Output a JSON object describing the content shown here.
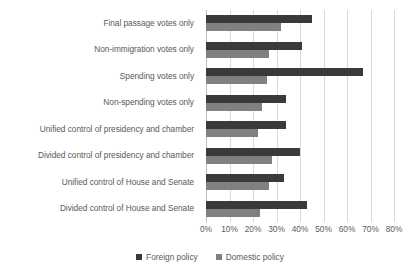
{
  "chart_data": {
    "type": "bar",
    "orientation": "horizontal",
    "title": "",
    "subtitle": "",
    "xlabel": "",
    "ylabel": "",
    "xlim": [
      0,
      80
    ],
    "xticks": [
      "0%",
      "10%",
      "20%",
      "30%",
      "40%",
      "50%",
      "60%",
      "70%",
      "80%"
    ],
    "xtick_values": [
      0,
      10,
      20,
      30,
      40,
      50,
      60,
      70,
      80
    ],
    "grid": true,
    "legend_position": "bottom",
    "categories": [
      "Final passage votes only",
      "Non-immigration votes only",
      "Spending votes only",
      "Non-spending votes only",
      "Unified control of presidency and chamber",
      "Divided control of presidency and chamber",
      "Unified control of House and Senate",
      "Divided control of House and Senate"
    ],
    "series": [
      {
        "name": "Foreign policy",
        "color": "#3a3a3a",
        "values": [
          45,
          41,
          67,
          34,
          34,
          40,
          33,
          43
        ]
      },
      {
        "name": "Domestic policy",
        "color": "#808080",
        "values": [
          32,
          27,
          26,
          24,
          22,
          28,
          27,
          23
        ]
      }
    ]
  },
  "colors": {
    "foreign": "#3a3a3a",
    "domestic": "#808080",
    "gridline": "#d9d9d9",
    "axis": "#bfbfbf",
    "text": "#595959",
    "background": "#ffffff"
  }
}
